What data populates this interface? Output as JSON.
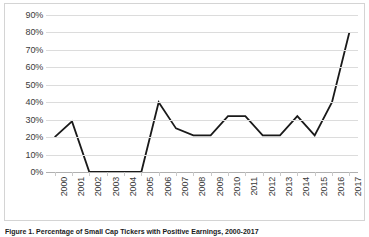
{
  "chart_data": {
    "type": "line",
    "title": "",
    "xlabel": "",
    "ylabel": "",
    "ylim": [
      0,
      90
    ],
    "ytick_labels": [
      "0%",
      "10%",
      "20%",
      "30%",
      "40%",
      "50%",
      "60%",
      "70%",
      "80%",
      "90%"
    ],
    "ytick_values": [
      0,
      10,
      20,
      30,
      40,
      50,
      60,
      70,
      80,
      90
    ],
    "grid": true,
    "legend": "none",
    "categories": [
      "2000",
      "2001",
      "2002",
      "2003",
      "2004",
      "2005",
      "2006",
      "2007",
      "2008",
      "2009",
      "2010",
      "2011",
      "2012",
      "2013",
      "2014",
      "2015",
      "2016",
      "2017"
    ],
    "values": [
      20,
      29,
      0,
      0,
      0,
      0,
      40,
      25,
      21,
      21,
      32,
      32,
      21,
      21,
      32,
      21,
      40,
      80
    ],
    "series_color": "#1a1a1a"
  },
  "caption": {
    "text": "Figure 1. Percentage of Small Cap Tickers with Positive Earnings, 2000-2017"
  }
}
